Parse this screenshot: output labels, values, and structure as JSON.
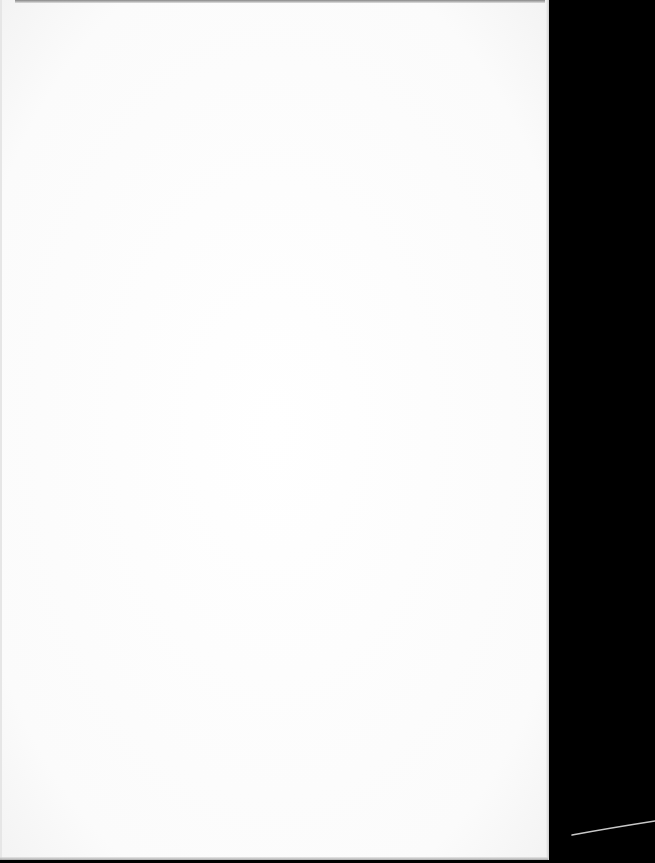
{
  "document": {
    "type": "scanned-page",
    "content": "",
    "colors": {
      "paper": "#fdfdfd",
      "background": "#000000",
      "edge_line": "#c8c8c8"
    }
  }
}
